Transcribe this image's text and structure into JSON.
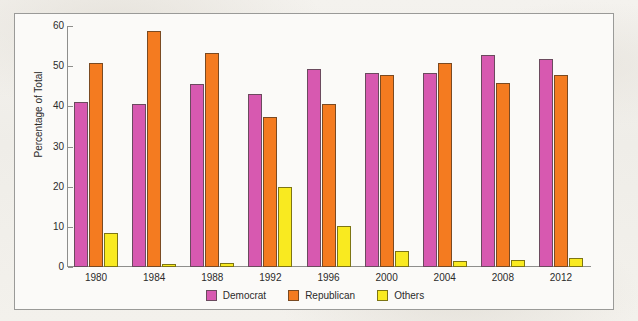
{
  "chart_data": {
    "type": "bar",
    "title": "",
    "subtitle": "",
    "xlabel": "",
    "ylabel": "Percentage of Total",
    "categories": [
      "1980",
      "1984",
      "1988",
      "1992",
      "1996",
      "2000",
      "2004",
      "2008",
      "2012"
    ],
    "series": [
      {
        "name": "Democrat",
        "color": "#d759b0",
        "values": [
          41.0,
          40.6,
          45.6,
          43.0,
          49.2,
          48.4,
          48.3,
          52.9,
          51.9
        ]
      },
      {
        "name": "Republican",
        "color": "#f47b20",
        "values": [
          50.7,
          58.8,
          53.4,
          37.4,
          40.7,
          47.9,
          50.7,
          45.7,
          47.9
        ]
      },
      {
        "name": "Others",
        "color": "#f9ea20",
        "values": [
          8.4,
          0.7,
          1.0,
          19.8,
          10.2,
          4.0,
          1.5,
          1.7,
          2.2
        ]
      }
    ],
    "ylim": [
      0,
      60
    ],
    "yticks": [
      0,
      10,
      20,
      30,
      40,
      50,
      60
    ],
    "ytick_labels": [
      "0",
      "10",
      "20",
      "30",
      "40",
      "50",
      "60"
    ],
    "grid": false,
    "legend_position": "bottom-center",
    "legend_entries": [
      "Democrat",
      "Republican",
      "Others"
    ]
  },
  "figure": {
    "background_color": "#fbfaf8",
    "page_background_color": "#f2f0ec",
    "frame_color": "#9a9a98",
    "axis_color": "#8e8e8c",
    "text_color": "#2b2b2b"
  }
}
